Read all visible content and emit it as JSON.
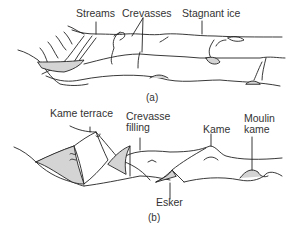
{
  "panel_a": {
    "caption": "(a)",
    "labels": {
      "streams": "Streams",
      "crevasses": "Crevasses",
      "stagnant_ice": "Stagnant ice"
    }
  },
  "panel_b": {
    "caption": "(b)",
    "labels": {
      "kame_terrace": "Kame terrace",
      "crevasse_filling_1": "Crevasse",
      "crevasse_filling_2": "filling",
      "kame": "Kame",
      "moulin_kame_1": "Moulin",
      "moulin_kame_2": "kame",
      "esker": "Esker"
    }
  },
  "colors": {
    "line": "#222222",
    "fill": "#d4d4d4"
  }
}
